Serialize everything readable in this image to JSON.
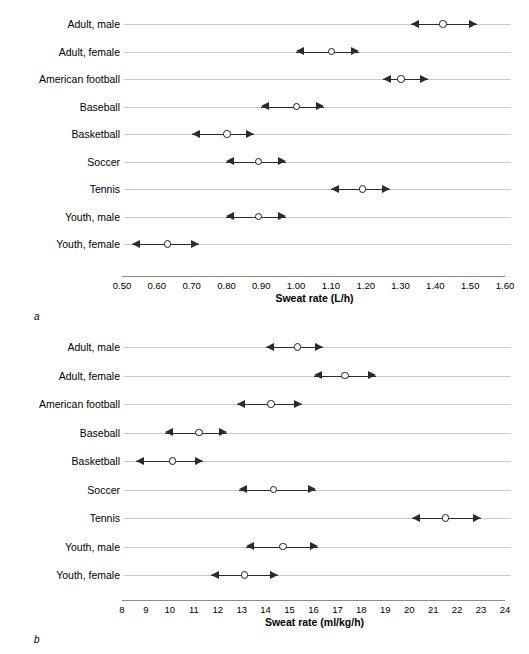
{
  "figure": {
    "panel_a_tag": "a",
    "panel_b_tag": "b"
  },
  "chart_data": [
    {
      "type": "scatter",
      "panel": "a",
      "title": "",
      "xlabel": "Sweat rate (L/h)",
      "ylabel": "",
      "xlim": [
        0.5,
        1.6
      ],
      "xticks": [
        "0.50",
        "0.60",
        "0.70",
        "0.80",
        "0.90",
        "1.00",
        "1.10",
        "1.20",
        "1.30",
        "1.40",
        "1.50",
        "1.60"
      ],
      "xtick_values": [
        0.5,
        0.6,
        0.7,
        0.8,
        0.9,
        1.0,
        1.1,
        1.2,
        1.3,
        1.4,
        1.5,
        1.6
      ],
      "grid": true,
      "legend": "none",
      "categories": [
        "Adult, male",
        "Adult, female",
        "American football",
        "Baseball",
        "Basketball",
        "Soccer",
        "Tennis",
        "Youth, male",
        "Youth, female"
      ],
      "values": [
        1.42,
        1.1,
        1.3,
        1.0,
        0.8,
        0.89,
        1.19,
        0.89,
        0.63
      ],
      "range_low": [
        1.33,
        1.0,
        1.25,
        0.9,
        0.7,
        0.8,
        1.1,
        0.8,
        0.53
      ],
      "range_high": [
        1.52,
        1.18,
        1.38,
        1.08,
        0.88,
        0.97,
        1.27,
        0.97,
        0.72
      ]
    },
    {
      "type": "scatter",
      "panel": "b",
      "title": "",
      "xlabel": "Sweat rate (ml/kg/h)",
      "ylabel": "",
      "xlim": [
        8,
        24
      ],
      "xticks": [
        "8",
        "9",
        "10",
        "11",
        "12",
        "13",
        "14",
        "15",
        "16",
        "17",
        "18",
        "19",
        "20",
        "21",
        "22",
        "23",
        "24"
      ],
      "xtick_values": [
        8,
        9,
        10,
        11,
        12,
        13,
        14,
        15,
        16,
        17,
        18,
        19,
        20,
        21,
        22,
        23,
        24
      ],
      "grid": true,
      "legend": "none",
      "categories": [
        "Adult, male",
        "Adult, female",
        "American football",
        "Baseball",
        "Basketball",
        "Soccer",
        "Tennis",
        "Youth, male",
        "Youth, female"
      ],
      "values": [
        15.3,
        17.3,
        14.2,
        11.2,
        10.1,
        14.3,
        21.5,
        14.7,
        13.1
      ],
      "range_low": [
        14.0,
        16.0,
        12.8,
        9.8,
        8.6,
        12.9,
        20.1,
        13.2,
        11.7
      ],
      "range_high": [
        16.4,
        18.6,
        15.5,
        12.4,
        11.4,
        16.1,
        23.0,
        16.2,
        14.5
      ]
    }
  ]
}
